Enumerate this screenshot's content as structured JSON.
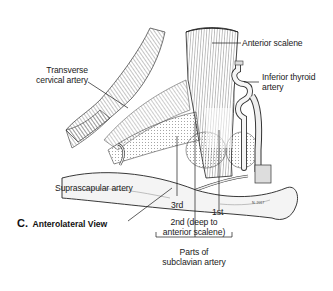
{
  "figure": {
    "panel_letter": "C.",
    "panel_title": "Anterolateral View",
    "labels": {
      "transverse_cervical": [
        "Transverse",
        "cervical artery"
      ],
      "anterior_scalene": "Anterior scalene",
      "inferior_thyroid": [
        "Inferior thyroid",
        "artery"
      ],
      "suprascapular": "Suprascapular artery",
      "part_3rd": "3rd",
      "part_1st": "1st",
      "part_2nd": [
        "2nd (deep to",
        "anterior scalene)"
      ],
      "group_caption": [
        "Parts of",
        "subclavian artery"
      ]
    },
    "colors": {
      "ink": "#1a1a1a",
      "shade": "#8a8a8a",
      "bone": "#f2f2f2",
      "background": "#ffffff"
    }
  }
}
